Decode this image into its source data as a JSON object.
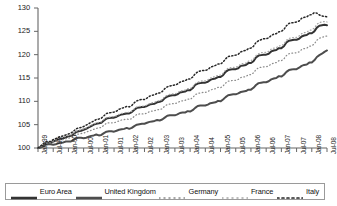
{
  "chart_data": {
    "type": "line",
    "title": "",
    "subtitle": "",
    "xlabel": "",
    "ylabel": "",
    "ylim": [
      100,
      130
    ],
    "yticks": [
      100,
      105,
      110,
      115,
      120,
      125,
      130
    ],
    "grid": false,
    "legend_position": "bottom",
    "x_tick_labels": [
      "Jan-99",
      "Jul-99",
      "Jan-00",
      "Jul-00",
      "Jan-01",
      "Jul-01",
      "Jan-02",
      "Jul-02",
      "Jan-03",
      "Jul-03",
      "Jan-04",
      "Jul-04",
      "Jan-05",
      "Jul-05",
      "Jan-06",
      "Jul-06",
      "Jan-07",
      "Jul-07",
      "Jan-08",
      "Jul-08"
    ],
    "x_start": "Jan-99",
    "x_end": "Jul-08",
    "x_points": 115,
    "series": [
      {
        "name": "Euro Area",
        "style": "solid-thick",
        "color": "#333333",
        "values": [
          100.0,
          100.2,
          100.5,
          101.0,
          101.1,
          101.1,
          101.4,
          101.6,
          101.9,
          102.0,
          102.1,
          102.3,
          102.5,
          102.6,
          103.0,
          103.4,
          103.6,
          103.7,
          103.9,
          104.1,
          104.4,
          104.7,
          105.0,
          105.2,
          105.3,
          105.4,
          105.9,
          106.3,
          106.4,
          106.5,
          106.5,
          106.7,
          107.0,
          107.2,
          107.3,
          107.4,
          107.4,
          107.7,
          108.2,
          108.6,
          108.7,
          108.8,
          108.8,
          109.0,
          109.3,
          109.4,
          109.5,
          109.8,
          109.9,
          110.1,
          110.7,
          111.0,
          111.2,
          111.3,
          111.3,
          111.5,
          111.9,
          112.0,
          112.1,
          112.4,
          112.4,
          112.8,
          113.5,
          113.8,
          113.9,
          114.0,
          114.0,
          114.2,
          114.6,
          114.8,
          114.9,
          115.2,
          115.2,
          115.6,
          116.3,
          116.7,
          116.8,
          116.9,
          116.9,
          117.1,
          117.6,
          117.7,
          117.8,
          118.2,
          118.2,
          118.6,
          119.4,
          119.8,
          119.9,
          120.0,
          120.0,
          120.2,
          120.7,
          120.9,
          121.0,
          121.4,
          121.4,
          121.8,
          122.6,
          123.0,
          123.1,
          123.2,
          123.2,
          123.4,
          123.9,
          124.1,
          124.2,
          124.6,
          124.6,
          125.0,
          125.8,
          126.2,
          126.3,
          126.4,
          126.3
        ]
      },
      {
        "name": "United Kingdom",
        "style": "solid-thick",
        "color": "#4d4d4d",
        "values": [
          100.0,
          100.1,
          100.3,
          100.7,
          100.8,
          100.8,
          100.7,
          100.8,
          101.0,
          101.1,
          101.2,
          101.4,
          101.4,
          101.4,
          101.7,
          102.1,
          102.2,
          102.2,
          102.1,
          102.2,
          102.4,
          102.6,
          102.7,
          102.9,
          102.7,
          102.8,
          103.2,
          103.5,
          103.6,
          103.6,
          103.5,
          103.7,
          103.9,
          104.0,
          104.1,
          104.3,
          104.1,
          104.3,
          104.7,
          105.0,
          105.1,
          105.2,
          105.2,
          105.4,
          105.6,
          105.7,
          105.8,
          106.0,
          105.9,
          106.1,
          106.5,
          106.9,
          107.0,
          107.0,
          107.0,
          107.2,
          107.5,
          107.6,
          107.6,
          107.9,
          107.8,
          108.1,
          108.6,
          109.0,
          109.1,
          109.1,
          109.1,
          109.3,
          109.6,
          109.7,
          109.8,
          110.1,
          110.0,
          110.4,
          110.9,
          111.3,
          111.4,
          111.5,
          111.5,
          111.7,
          112.0,
          112.1,
          112.2,
          112.5,
          112.5,
          112.9,
          113.5,
          113.9,
          114.0,
          114.1,
          114.1,
          114.3,
          114.7,
          114.9,
          115.0,
          115.4,
          115.3,
          115.7,
          116.3,
          116.7,
          116.8,
          116.9,
          116.9,
          117.2,
          117.6,
          117.8,
          117.9,
          118.3,
          118.3,
          118.8,
          119.5,
          119.9,
          120.2,
          120.6,
          120.9
        ]
      },
      {
        "name": "Germany",
        "style": "dotted-light",
        "color": "#8c8c8c",
        "values": [
          100.0,
          100.3,
          100.6,
          101.0,
          101.1,
          101.1,
          101.3,
          101.4,
          101.6,
          101.7,
          101.8,
          102.0,
          102.1,
          102.2,
          102.5,
          102.9,
          103.0,
          103.1,
          103.2,
          103.4,
          103.6,
          103.8,
          104.0,
          104.2,
          104.3,
          104.4,
          104.9,
          105.3,
          105.4,
          105.4,
          105.4,
          105.6,
          105.8,
          106.0,
          106.1,
          106.2,
          106.1,
          106.3,
          106.8,
          107.2,
          107.3,
          107.3,
          107.3,
          107.5,
          107.8,
          107.9,
          108.0,
          108.2,
          108.2,
          108.4,
          109.0,
          109.3,
          109.4,
          109.5,
          109.5,
          109.7,
          110.0,
          110.1,
          110.2,
          110.5,
          110.4,
          110.8,
          111.4,
          111.7,
          111.8,
          111.9,
          111.9,
          112.1,
          112.4,
          112.6,
          112.7,
          113.0,
          112.9,
          113.3,
          113.9,
          114.3,
          114.4,
          114.5,
          114.5,
          114.7,
          115.1,
          115.2,
          115.3,
          115.7,
          115.7,
          116.1,
          116.8,
          117.2,
          117.3,
          117.4,
          117.4,
          117.6,
          118.0,
          118.2,
          118.3,
          118.7,
          118.7,
          119.1,
          119.8,
          120.2,
          120.3,
          120.4,
          120.4,
          120.6,
          121.1,
          121.3,
          121.4,
          121.8,
          121.9,
          122.3,
          123.1,
          123.5,
          123.7,
          123.9,
          124.0
        ]
      },
      {
        "name": "France",
        "style": "dotted-light",
        "color": "#a6a6a6",
        "values": [
          100.0,
          100.4,
          100.8,
          101.2,
          101.3,
          101.3,
          101.6,
          101.8,
          102.1,
          102.2,
          102.3,
          102.5,
          102.7,
          102.8,
          103.2,
          103.6,
          103.8,
          103.9,
          104.1,
          104.3,
          104.6,
          104.9,
          105.1,
          105.4,
          105.5,
          105.6,
          106.1,
          106.5,
          106.6,
          106.7,
          106.7,
          106.9,
          107.2,
          107.4,
          107.5,
          107.7,
          107.6,
          107.9,
          108.4,
          108.8,
          108.9,
          109.0,
          109.0,
          109.2,
          109.5,
          109.7,
          109.8,
          110.1,
          110.1,
          110.4,
          111.0,
          111.3,
          111.5,
          111.6,
          111.6,
          111.8,
          112.2,
          112.3,
          112.4,
          112.7,
          112.7,
          113.1,
          113.8,
          114.1,
          114.3,
          114.4,
          114.4,
          114.6,
          115.0,
          115.2,
          115.3,
          115.6,
          115.6,
          116.0,
          116.7,
          117.1,
          117.2,
          117.3,
          117.3,
          117.5,
          118.0,
          118.1,
          118.2,
          118.6,
          118.7,
          119.1,
          119.8,
          120.2,
          120.4,
          120.5,
          120.5,
          120.7,
          121.2,
          121.4,
          121.5,
          121.9,
          121.9,
          122.3,
          123.1,
          123.5,
          123.6,
          123.7,
          123.7,
          124.0,
          124.5,
          124.7,
          124.8,
          125.2,
          125.3,
          125.7,
          126.5,
          126.9,
          127.0,
          127.1,
          127.0
        ]
      },
      {
        "name": "Italy",
        "style": "dashed-dotted",
        "color": "#262626",
        "values": [
          100.0,
          100.4,
          100.9,
          101.3,
          101.4,
          101.4,
          101.8,
          102.0,
          102.3,
          102.5,
          102.6,
          102.8,
          103.0,
          103.2,
          103.6,
          104.1,
          104.3,
          104.4,
          104.6,
          104.9,
          105.2,
          105.5,
          105.8,
          106.1,
          106.2,
          106.4,
          106.9,
          107.4,
          107.5,
          107.6,
          107.7,
          107.9,
          108.3,
          108.5,
          108.7,
          108.9,
          108.8,
          109.1,
          109.7,
          110.1,
          110.3,
          110.4,
          110.4,
          110.7,
          111.1,
          111.3,
          111.4,
          111.7,
          111.8,
          112.1,
          112.7,
          113.1,
          113.3,
          113.4,
          113.5,
          113.7,
          114.1,
          114.3,
          114.4,
          114.8,
          114.8,
          115.2,
          115.9,
          116.3,
          116.5,
          116.6,
          116.6,
          116.8,
          117.3,
          117.5,
          117.7,
          118.0,
          118.0,
          118.4,
          119.1,
          119.6,
          119.7,
          119.8,
          119.9,
          120.1,
          120.6,
          120.8,
          120.9,
          121.3,
          121.4,
          121.8,
          122.6,
          123.0,
          123.2,
          123.4,
          123.4,
          123.6,
          124.1,
          124.4,
          124.5,
          124.9,
          125.0,
          125.4,
          126.2,
          126.7,
          126.8,
          126.9,
          127.0,
          127.2,
          127.8,
          128.0,
          128.1,
          128.5,
          128.6,
          129.0,
          128.9,
          128.5,
          128.3,
          128.2,
          128.1
        ]
      }
    ]
  },
  "legend": {
    "items": [
      {
        "label": "Euro Area"
      },
      {
        "label": "United Kingdom"
      },
      {
        "label": "Germany"
      },
      {
        "label": "France"
      },
      {
        "label": "Italy"
      }
    ]
  }
}
